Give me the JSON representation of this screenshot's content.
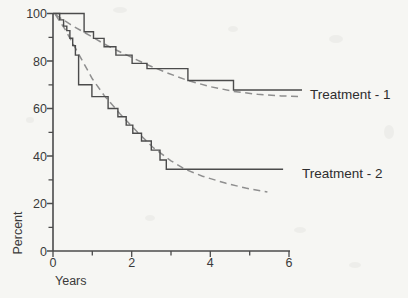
{
  "chart_data": {
    "type": "line",
    "title": "",
    "xlabel": "Years",
    "ylabel": "Percent",
    "xlim": [
      0,
      6
    ],
    "ylim": [
      0,
      100
    ],
    "grid": false,
    "x_major_ticks": [
      0,
      2,
      4,
      6
    ],
    "x_minor_ticks": [
      1,
      3,
      5
    ],
    "y_major_ticks": [
      0,
      20,
      40,
      60,
      80,
      100
    ],
    "y_minor_ticks": [
      10,
      30,
      50,
      70,
      90
    ],
    "x_tick_labels": [
      "0",
      "2",
      "4",
      "6"
    ],
    "y_tick_labels": [
      "100",
      "80",
      "60",
      "40",
      "20",
      "0"
    ],
    "axis_color": "#4b4b4b",
    "series": [
      {
        "key": "t1-km",
        "name": "Treatment - 1",
        "curve": "kaplan-meier-step",
        "line_style": "solid",
        "line_color": "#4b4b4b",
        "steps": [
          [
            0,
            100
          ],
          [
            0.79,
            92.3
          ],
          [
            1.03,
            89.5
          ],
          [
            1.3,
            86.0
          ],
          [
            1.6,
            82.5
          ],
          [
            2.01,
            79.0
          ],
          [
            2.39,
            76.8
          ],
          [
            3.43,
            71.8
          ],
          [
            4.59,
            67.8
          ]
        ],
        "end_x": 6.33
      },
      {
        "key": "t1-fit",
        "name": "Treatment - 1 (fitted)",
        "curve": "fitted-smooth",
        "line_style": "dashed",
        "line_color": "#8f8f8f",
        "points": [
          [
            0.06,
            99.5
          ],
          [
            0.45,
            95.3
          ],
          [
            0.82,
            91.8
          ],
          [
            1.05,
            89.6
          ],
          [
            1.3,
            87.2
          ],
          [
            1.62,
            84.5
          ],
          [
            2.0,
            81.5
          ],
          [
            2.4,
            78.4
          ],
          [
            2.9,
            75.0
          ],
          [
            3.43,
            71.8
          ],
          [
            4.0,
            69.2
          ],
          [
            4.6,
            67.2
          ],
          [
            5.2,
            66.0
          ],
          [
            5.8,
            65.3
          ],
          [
            6.25,
            65.0
          ]
        ]
      },
      {
        "key": "t2-km",
        "name": "Treatment - 2",
        "curve": "kaplan-meier-step",
        "line_style": "solid",
        "line_color": "#4b4b4b",
        "steps": [
          [
            0,
            100
          ],
          [
            0.17,
            97.3
          ],
          [
            0.27,
            94.7
          ],
          [
            0.35,
            92.8
          ],
          [
            0.43,
            89.6
          ],
          [
            0.5,
            86.5
          ],
          [
            0.57,
            82.5
          ],
          [
            0.65,
            70.0
          ],
          [
            0.99,
            65.0
          ],
          [
            1.4,
            60.0
          ],
          [
            1.65,
            56.5
          ],
          [
            1.86,
            53.0
          ],
          [
            2.03,
            49.6
          ],
          [
            2.25,
            46.3
          ],
          [
            2.5,
            42.5
          ],
          [
            2.72,
            38.3
          ],
          [
            2.88,
            34.4
          ]
        ],
        "end_x": 5.85
      },
      {
        "key": "t2-fit",
        "name": "Treatment - 2 (fitted)",
        "curve": "fitted-smooth",
        "line_style": "dashed",
        "line_color": "#8f8f8f",
        "points": [
          [
            0.06,
            99.5
          ],
          [
            0.3,
            93.5
          ],
          [
            0.5,
            87.5
          ],
          [
            0.75,
            80.0
          ],
          [
            1.0,
            72.5
          ],
          [
            1.3,
            65.5
          ],
          [
            1.7,
            57.8
          ],
          [
            2.15,
            50.0
          ],
          [
            2.55,
            43.5
          ],
          [
            3.0,
            38.0
          ],
          [
            3.35,
            34.5
          ],
          [
            3.8,
            31.5
          ],
          [
            4.4,
            28.5
          ],
          [
            4.9,
            26.5
          ],
          [
            5.45,
            24.9
          ]
        ]
      }
    ]
  },
  "annotations": {
    "treatment1_label": "Treatment - 1",
    "treatment2_label": "Treatment - 2"
  }
}
